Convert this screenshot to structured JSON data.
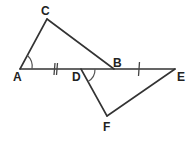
{
  "diagram": {
    "type": "geometry",
    "points": {
      "A": {
        "label": "A",
        "x": 20,
        "y": 69
      },
      "C": {
        "label": "C",
        "x": 47,
        "y": 19
      },
      "B": {
        "label": "B",
        "x": 114,
        "y": 69
      },
      "D": {
        "label": "D",
        "x": 81,
        "y": 69
      },
      "E": {
        "label": "E",
        "x": 175,
        "y": 69
      },
      "F": {
        "label": "F",
        "x": 107,
        "y": 116
      }
    },
    "segments": [
      [
        "A",
        "C"
      ],
      [
        "C",
        "B"
      ],
      [
        "A",
        "E"
      ],
      [
        "D",
        "F"
      ],
      [
        "F",
        "E"
      ]
    ],
    "congruence_marks": {
      "AD": "single tick",
      "BE": "single tick"
    },
    "angle_marks": [
      "angle at A (CAB)",
      "angle at D (FDE)"
    ],
    "colors": {
      "line": "#333333",
      "label": "#222222",
      "background": "#ffffff"
    }
  }
}
